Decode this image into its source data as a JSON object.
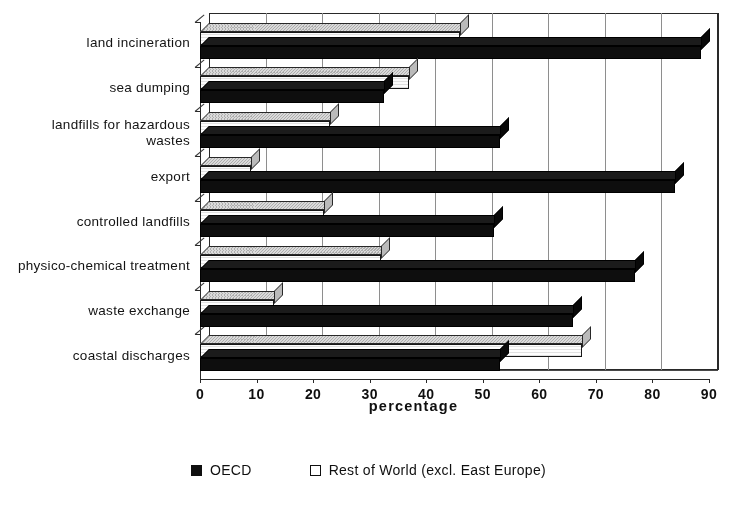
{
  "chart_data": {
    "type": "bar",
    "orientation": "horizontal",
    "grouped": true,
    "three_d": true,
    "title": "",
    "subtitle": "",
    "xlabel": "percentage",
    "ylabel": "",
    "xlim": [
      0,
      90
    ],
    "xticks": [
      0,
      10,
      20,
      30,
      40,
      50,
      60,
      70,
      80,
      90
    ],
    "xtick_labels": [
      "0",
      "10",
      "20",
      "30",
      "40",
      "50",
      "60",
      "70",
      "80",
      "90"
    ],
    "grid": "vertical",
    "legend_position": "bottom",
    "categories": [
      "land incineration",
      "sea dumping",
      "landfills for hazardous\nwastes",
      "export",
      "controlled landfills",
      "physico-chemical treatment",
      "waste exchange",
      "coastal discharges"
    ],
    "series": [
      {
        "name": "OECD",
        "color": "#111111",
        "fill": "solid-black",
        "values": [
          88.5,
          32.5,
          53.0,
          84.0,
          52.0,
          77.0,
          66.0,
          53.0
        ]
      },
      {
        "name": "Rest of World (excl. East Europe)",
        "color": "#ffffff",
        "fill": "white-outline",
        "values": [
          46.0,
          37.0,
          23.0,
          9.0,
          22.0,
          32.0,
          13.0,
          67.5
        ]
      }
    ]
  },
  "legend": {
    "items": [
      {
        "label": "OECD",
        "swatch": "filled-square-icon"
      },
      {
        "label": "Rest of World (excl. East Europe)",
        "swatch": "hollow-square-icon"
      }
    ]
  },
  "axis": {
    "x_title": "percentage"
  }
}
